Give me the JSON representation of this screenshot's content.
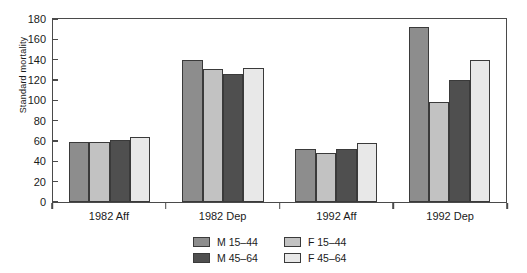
{
  "chart_data": {
    "type": "bar",
    "title": "",
    "xlabel": "",
    "ylabel": "Standard mortality",
    "categories": [
      "1982 Aff",
      "1982 Dep",
      "1992 Aff",
      "1992 Dep"
    ],
    "ylim": [
      0,
      180
    ],
    "yticks": [
      0,
      20,
      40,
      60,
      80,
      100,
      120,
      140,
      160,
      180
    ],
    "grid": false,
    "legend_position": "bottom",
    "series": [
      {
        "name": "M 15-44",
        "color": "#8d8d8d",
        "values": [
          59,
          140,
          52,
          172
        ]
      },
      {
        "name": "F 15-44",
        "color": "#c2c2c2",
        "values": [
          59,
          131,
          48,
          98
        ]
      },
      {
        "name": "M 45-64",
        "color": "#4f4f4f",
        "values": [
          61,
          126,
          52,
          120
        ]
      },
      {
        "name": "F 45-64",
        "color": "#e8e8e8",
        "values": [
          64,
          132,
          58,
          140
        ]
      }
    ]
  }
}
